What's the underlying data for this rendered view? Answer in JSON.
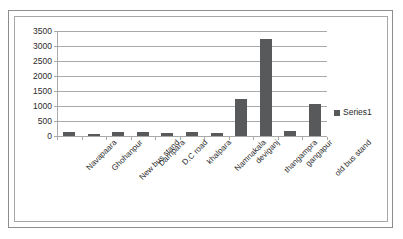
{
  "chart_data": {
    "type": "bar",
    "title": "",
    "xlabel": "",
    "ylabel": "",
    "ylim": [
      0,
      3500
    ],
    "yticks": [
      0,
      500,
      1000,
      1500,
      2000,
      2500,
      3000,
      3500
    ],
    "ytick_labels": [
      "0",
      "500",
      "1000",
      "1500",
      "2000",
      "2500",
      "3000",
      "3500"
    ],
    "grid": true,
    "legend_position": "right",
    "legend": [
      "Series1"
    ],
    "categories": [
      "Navapaara",
      "Ghohanpur",
      "New bus stand",
      "Darripara",
      "D.C road",
      "khalpara",
      "Namnakala",
      "deviganj",
      "thangampra",
      "gangapur",
      "old bus stand"
    ],
    "series": [
      {
        "name": "Series1",
        "color": "#58595b",
        "values": [
          130,
          75,
          145,
          140,
          105,
          130,
          110,
          1250,
          3250,
          180,
          1070
        ]
      }
    ]
  },
  "legend": {
    "series1_label": "Series1",
    "marker_color": "#58595b"
  },
  "colors": {
    "bar": "#58595b",
    "gridline": "#a9a9a9",
    "axis": "#a9a9a9",
    "frame_outer": "#8d8d8d",
    "frame_inner": "#a6a6a6",
    "text": "#2b2b2b",
    "background": "#ffffff"
  }
}
